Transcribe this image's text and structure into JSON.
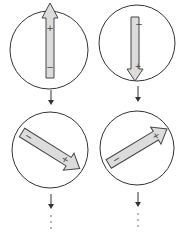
{
  "diagram": {
    "columns": [
      {
        "id": "left",
        "steps": [
          {
            "orientation": "up",
            "head_label": "+",
            "tail_label": "−"
          },
          {
            "orientation": "down-right",
            "head_label": "+",
            "tail_label": "−"
          }
        ],
        "continuation": "⋮"
      },
      {
        "id": "right",
        "steps": [
          {
            "orientation": "down",
            "head_label": "+",
            "tail_label": "−"
          },
          {
            "orientation": "up-right",
            "head_label": "+",
            "tail_label": "−"
          }
        ],
        "continuation": "⋮"
      }
    ],
    "colors": {
      "stroke": "#333333",
      "arrow_fill": "#dcdcdc",
      "background": "#ffffff"
    }
  }
}
